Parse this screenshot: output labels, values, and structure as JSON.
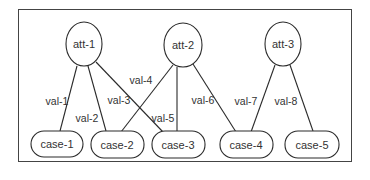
{
  "diagram": {
    "type": "bipartite-graph",
    "attributes": [
      {
        "id": "att1",
        "label": "att-1"
      },
      {
        "id": "att2",
        "label": "att-2"
      },
      {
        "id": "att3",
        "label": "att-3"
      }
    ],
    "cases": [
      {
        "id": "case1",
        "label": "case-1"
      },
      {
        "id": "case2",
        "label": "case-2"
      },
      {
        "id": "case3",
        "label": "case-3"
      },
      {
        "id": "case4",
        "label": "case-4"
      },
      {
        "id": "case5",
        "label": "case-5"
      }
    ],
    "edges": [
      {
        "from": "att-1",
        "to": "case-1",
        "label": "val-1"
      },
      {
        "from": "att-1",
        "to": "case-2",
        "label": "val-2"
      },
      {
        "from": "att-1",
        "to": "case-3",
        "label": "val-3"
      },
      {
        "from": "att-2",
        "to": "case-2",
        "label": "val-4"
      },
      {
        "from": "att-2",
        "to": "case-3",
        "label": "val-5"
      },
      {
        "from": "att-2",
        "to": "case-4",
        "label": "val-6"
      },
      {
        "from": "att-3",
        "to": "case-4",
        "label": "val-7"
      },
      {
        "from": "att-3",
        "to": "case-5",
        "label": "val-8"
      }
    ]
  }
}
